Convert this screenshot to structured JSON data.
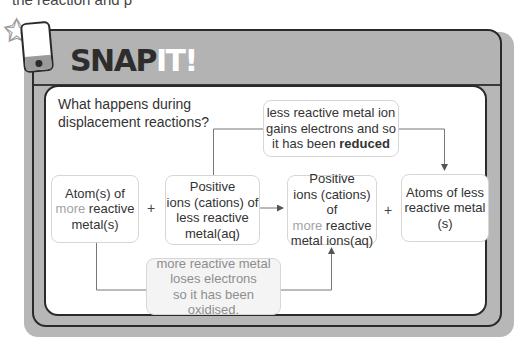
{
  "page": {
    "top_text": "the reaction and                                      p"
  },
  "header": {
    "title_part1": "SNAP",
    "title_part2": "IT!"
  },
  "question": {
    "line1": "What happens during",
    "line2": "displacement reactions?"
  },
  "boxes": {
    "reactant1": {
      "line1": "Atom(s) of",
      "more": "more",
      "line2_rest": " reactive",
      "line3": "metal(s)"
    },
    "reactant2": {
      "line1": "Positive",
      "line2": "ions (cations) of",
      "line3": "less reactive",
      "line4": "metal(aq)"
    },
    "product1": {
      "line1": "Positive",
      "line2": "ions (cations) of",
      "more": "more",
      "line3_rest": " reactive",
      "line4": "metal ions(aq)"
    },
    "product2": {
      "line1": "Atoms of less",
      "line2": "reactive metal",
      "line3": "(s)"
    },
    "reduced_note": {
      "line1": "less reactive metal ion",
      "line2": "gains electrons and so",
      "line3_pre": "it has been ",
      "line3_bold": "reduced"
    },
    "oxidised_note": {
      "line1": "more reactive metal",
      "line2": "loses electrons",
      "line3": "so it has been oxidised."
    }
  },
  "operators": {
    "plus1": "+",
    "plus2": "+"
  },
  "colors": {
    "frame_grey": "#b7b7b7",
    "frame_dark": "#2a2a2a",
    "more_text": "#a3a3a3",
    "note_grey_text": "#8e8e8e"
  }
}
